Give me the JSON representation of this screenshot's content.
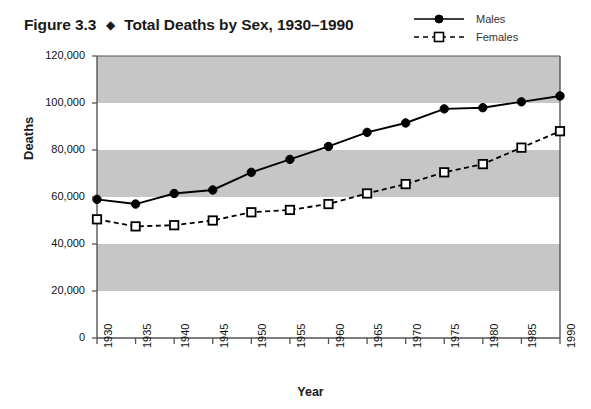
{
  "figure": {
    "number": "Figure 3.3",
    "separator": "◆",
    "title": "Total Deaths by Sex, 1930–1990"
  },
  "legend": {
    "position": "top-right",
    "items": [
      {
        "label": "Males",
        "marker": "filled-circle",
        "line": "solid",
        "color": "#000000"
      },
      {
        "label": "Females",
        "marker": "open-square",
        "line": "dashed",
        "color": "#000000"
      }
    ]
  },
  "style": {
    "band_color": "#c6c6c6",
    "plot_background": "#ffffff",
    "axis_color": "#555555",
    "series_color": "#000000"
  },
  "chart_data": {
    "type": "line",
    "title": "Total Deaths by Sex, 1930–1990",
    "xlabel": "Year",
    "ylabel": "Deaths",
    "x": [
      1930,
      1935,
      1940,
      1945,
      1950,
      1955,
      1960,
      1965,
      1970,
      1975,
      1980,
      1985,
      1990
    ],
    "categories": [
      "1930",
      "1935",
      "1940",
      "1945",
      "1950",
      "1955",
      "1960",
      "1965",
      "1970",
      "1975",
      "1980",
      "1985",
      "1990"
    ],
    "xlim": [
      1930,
      1990
    ],
    "ylim": [
      0,
      120000
    ],
    "ytick_labels": [
      "0",
      "20,000",
      "40,000",
      "60,000",
      "80,000",
      "100,000",
      "120,000"
    ],
    "yticks": [
      0,
      20000,
      40000,
      60000,
      80000,
      100000,
      120000
    ],
    "grid": false,
    "banded_background": true,
    "band_ranges": [
      [
        20000,
        40000
      ],
      [
        60000,
        80000
      ],
      [
        100000,
        120000
      ]
    ],
    "legend_position": "top-right",
    "series": [
      {
        "name": "Males",
        "marker": "filled-circle",
        "line": "solid",
        "values": [
          59000,
          57000,
          61500,
          63000,
          70500,
          76000,
          81500,
          87500,
          91500,
          97500,
          98000,
          100500,
          103000
        ]
      },
      {
        "name": "Females",
        "marker": "open-square",
        "line": "dashed",
        "values": [
          50500,
          47500,
          48000,
          50000,
          53500,
          54500,
          57000,
          61500,
          65500,
          70500,
          74000,
          81000,
          88000
        ]
      }
    ]
  }
}
